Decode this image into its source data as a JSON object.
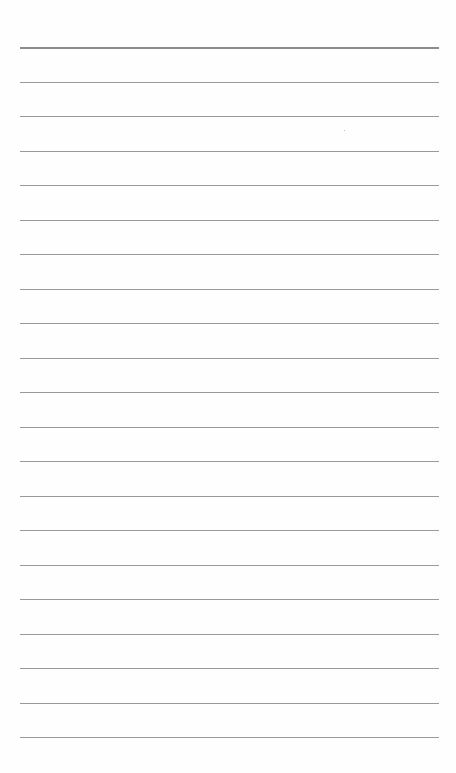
{
  "page": {
    "type": "blank ruled sheet",
    "background": "#fefefe",
    "rule_color": "#9a9a9a",
    "rule_count": 21,
    "first_rule_y": 47,
    "rule_spacing": 34.5,
    "rule_left": 20,
    "rule_right": 439
  }
}
